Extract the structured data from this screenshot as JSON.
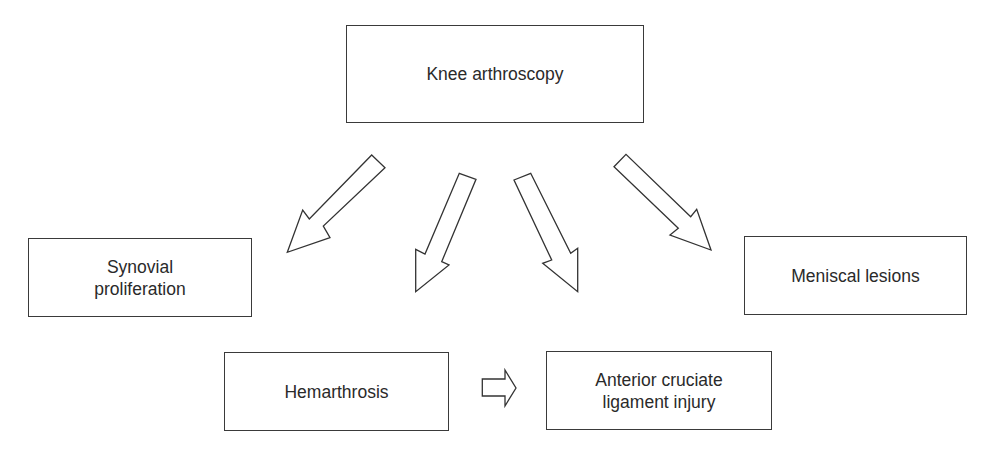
{
  "diagram": {
    "root": {
      "id": "knee-arthroscopy",
      "label": "Knee arthroscopy"
    },
    "findings": [
      {
        "id": "synovial-proliferation",
        "label": "Synovial\nproliferation"
      },
      {
        "id": "hemarthrosis",
        "label": "Hemarthrosis"
      },
      {
        "id": "acl-injury",
        "label": "Anterior cruciate\nligament injury"
      },
      {
        "id": "meniscal-lesions",
        "label": "Meniscal lesions"
      }
    ],
    "edges": [
      {
        "from": "knee-arthroscopy",
        "to": "synovial-proliferation"
      },
      {
        "from": "knee-arthroscopy",
        "to": "hemarthrosis"
      },
      {
        "from": "knee-arthroscopy",
        "to": "acl-injury"
      },
      {
        "from": "knee-arthroscopy",
        "to": "meniscal-lesions"
      },
      {
        "from": "hemarthrosis",
        "to": "acl-injury"
      }
    ],
    "colors": {
      "stroke": "#333333",
      "background": "#ffffff",
      "text": "#2a2a2a"
    }
  }
}
